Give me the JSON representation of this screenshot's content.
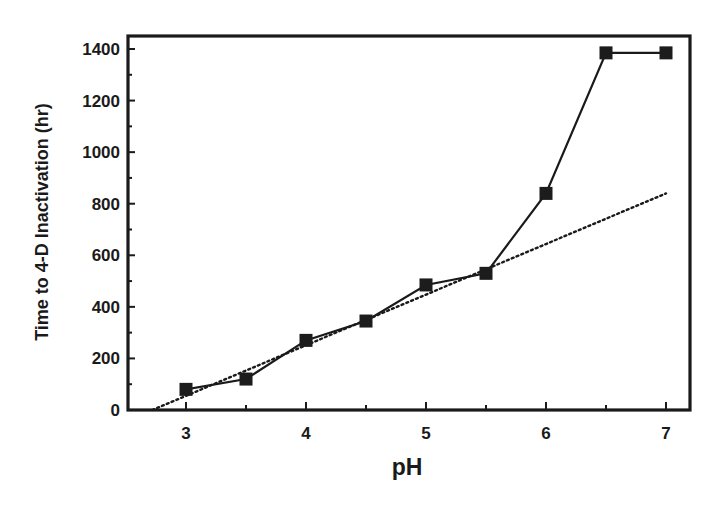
{
  "chart_data": {
    "type": "line",
    "title": "",
    "xlabel": "pH",
    "ylabel": "Time to 4-D Inactivation (hr)",
    "xlim": [
      2.5,
      7.2
    ],
    "ylim": [
      0,
      1450
    ],
    "xticks": [
      3,
      4,
      5,
      6,
      7
    ],
    "xtick_labels": [
      "3",
      "4",
      "5",
      "6",
      "7"
    ],
    "x_minor_ticks": [
      3.5,
      4.5,
      5.5,
      6.5
    ],
    "yticks": [
      0,
      200,
      400,
      600,
      800,
      1000,
      1200,
      1400
    ],
    "ytick_labels": [
      "0",
      "200",
      "400",
      "600",
      "800",
      "1000",
      "1200",
      "1400"
    ],
    "y_minor_ticks": [
      100,
      300,
      500,
      700,
      900,
      1100,
      1300
    ],
    "grid": false,
    "legend": null,
    "series": [
      {
        "name": "Measured",
        "style": "solid line with filled square markers",
        "color": "#1a1a1a",
        "x": [
          3,
          3.5,
          4,
          4.5,
          5,
          5.5,
          6,
          6.5,
          7
        ],
        "values": [
          80,
          120,
          270,
          345,
          485,
          530,
          840,
          1385,
          1385
        ]
      },
      {
        "name": "Linear fit",
        "style": "dotted line",
        "color": "#1a1a1a",
        "x": [
          2.72,
          7
        ],
        "values": [
          0,
          840
        ]
      }
    ]
  }
}
